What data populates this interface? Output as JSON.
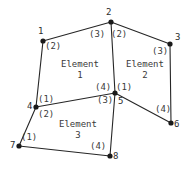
{
  "figure": {
    "type": "finite-element-mesh-diagram",
    "background_color": "#ffffff",
    "line_color": "#262626",
    "text_color": "#3a3a3a",
    "width": 189,
    "height": 171
  },
  "nodes": [
    {
      "id": "1",
      "label": "1",
      "x": 43,
      "y": 41,
      "label_x": 38,
      "label_y": 27
    },
    {
      "id": "2",
      "label": "2",
      "x": 111,
      "y": 22,
      "label_x": 106,
      "label_y": 8
    },
    {
      "id": "3",
      "label": "3",
      "x": 170,
      "y": 44,
      "label_x": 175,
      "label_y": 33
    },
    {
      "id": "4",
      "label": "4",
      "x": 36,
      "y": 107,
      "label_x": 27,
      "label_y": 102
    },
    {
      "id": "5",
      "label": "5",
      "x": 115,
      "y": 93,
      "label_x": 118,
      "label_y": 97
    },
    {
      "id": "6",
      "label": "6",
      "x": 171,
      "y": 123,
      "label_x": 174,
      "label_y": 120
    },
    {
      "id": "7",
      "label": "7",
      "x": 19,
      "y": 146,
      "label_x": 10,
      "label_y": 141
    },
    {
      "id": "8",
      "label": "8",
      "x": 110,
      "y": 156,
      "label_x": 113,
      "label_y": 152
    }
  ],
  "edges": [
    {
      "from": "1",
      "to": "2"
    },
    {
      "from": "2",
      "to": "3"
    },
    {
      "from": "2",
      "to": "5"
    },
    {
      "from": "3",
      "to": "6"
    },
    {
      "from": "5",
      "to": "6"
    },
    {
      "from": "1",
      "to": "4"
    },
    {
      "from": "4",
      "to": "5"
    },
    {
      "from": "4",
      "to": "7"
    },
    {
      "from": "7",
      "to": "8"
    },
    {
      "from": "8",
      "to": "5"
    }
  ],
  "elements": [
    {
      "id": "element-1",
      "name": "Element",
      "number": "1",
      "label_x": 80,
      "label_y": 59,
      "connectivity": [
        "4",
        "1",
        "2",
        "5"
      ]
    },
    {
      "id": "element-2",
      "name": "Element",
      "number": "2",
      "label_x": 145,
      "label_y": 59,
      "connectivity": [
        "5",
        "2",
        "3",
        "6"
      ]
    },
    {
      "id": "element-3",
      "name": "Element",
      "number": "3",
      "label_x": 78,
      "label_y": 119,
      "connectivity": [
        "7",
        "4",
        "5",
        "8"
      ]
    }
  ],
  "local_node_labels": [
    {
      "text": "(2)",
      "x": 45,
      "y": 42,
      "element": "element-1",
      "node": "1"
    },
    {
      "text": "(3)",
      "x": 89,
      "y": 30,
      "element": "element-1",
      "node": "2"
    },
    {
      "text": "(1)",
      "x": 38,
      "y": 95,
      "element": "element-1",
      "node": "4"
    },
    {
      "text": "(4)",
      "x": 95,
      "y": 83,
      "element": "element-1",
      "node": "5"
    },
    {
      "text": "(2)",
      "x": 111,
      "y": 30,
      "element": "element-2",
      "node": "2"
    },
    {
      "text": "(3)",
      "x": 152,
      "y": 47,
      "element": "element-2",
      "node": "3"
    },
    {
      "text": "(1)",
      "x": 116,
      "y": 83,
      "element": "element-2",
      "node": "5"
    },
    {
      "text": "(4)",
      "x": 155,
      "y": 105,
      "element": "element-2",
      "node": "6"
    },
    {
      "text": "(2)",
      "x": 38,
      "y": 110,
      "element": "element-3",
      "node": "4"
    },
    {
      "text": "(3)",
      "x": 97,
      "y": 96,
      "element": "element-3",
      "node": "5"
    },
    {
      "text": "(1)",
      "x": 21,
      "y": 133,
      "element": "element-3",
      "node": "7"
    },
    {
      "text": "(4)",
      "x": 90,
      "y": 142,
      "element": "element-3",
      "node": "8"
    }
  ]
}
